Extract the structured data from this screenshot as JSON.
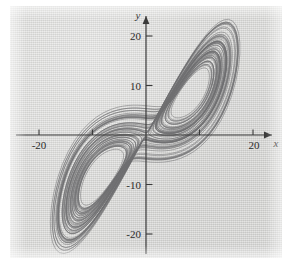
{
  "figure": {
    "background_color": "#d8d8d6",
    "border_color": "#ffffff",
    "curve_color": "#6f6f70",
    "axis_color": "#3a3a3a"
  },
  "axes": {
    "x_name": "x",
    "y_name": "y"
  },
  "chart_data": {
    "type": "line",
    "title": "",
    "subtitle": "",
    "xlabel": "x",
    "ylabel": "y",
    "grid": false,
    "legend": "none",
    "annotations": [],
    "xlim": [
      -29,
      28
    ],
    "ylim": [
      -26,
      26
    ],
    "xticks": [
      -20,
      20
    ],
    "xtick_labels": [
      "-20",
      "20"
    ],
    "xticks_unlabeled": [
      -10,
      10
    ],
    "yticks": [
      -20,
      -10,
      10,
      20
    ],
    "ytick_labels": [
      "-20",
      "-10",
      "10",
      "20"
    ],
    "lobe_centers": [
      [
        10.0,
        12.0
      ],
      [
        -10.0,
        -12.0
      ]
    ],
    "series": [
      {
        "name": "trajectory",
        "color": "#6f6f70",
        "x": [],
        "y": []
      }
    ]
  }
}
